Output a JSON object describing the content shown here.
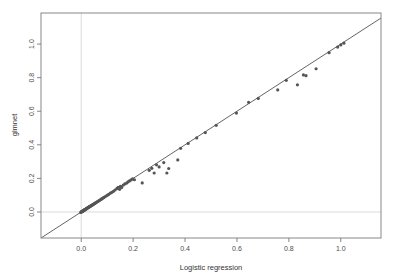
{
  "figure": {
    "background_color": "#ffffff",
    "plot_area": {
      "left": 41,
      "top": 13,
      "right": 381,
      "bottom": 238
    }
  },
  "chart_data": {
    "type": "scatter",
    "title": "",
    "xlabel": "Logistic regression",
    "ylabel": "glmnet",
    "xlim": [
      -0.155,
      1.155
    ],
    "ylim": [
      -0.155,
      1.185
    ],
    "xticks": [
      0.0,
      0.2,
      0.4,
      0.6,
      0.8,
      1.0
    ],
    "xtick_labels": [
      "0.0",
      "0.2",
      "0.4",
      "0.6",
      "0.8",
      "1.0"
    ],
    "yticks": [
      0.0,
      0.2,
      0.4,
      0.6,
      0.8,
      1.0
    ],
    "ytick_labels": [
      "0.0",
      "0.2",
      "0.4",
      "0.6",
      "0.8",
      "1.0"
    ],
    "grid": false,
    "legend": false,
    "reference_lines": {
      "identity_line": {
        "name": "y = x diagonal",
        "color": "#3c3c3c",
        "width": 0.8,
        "from": [
          -0.155,
          -0.155
        ],
        "to": [
          1.155,
          1.155
        ]
      },
      "zero_vertical": {
        "name": "x = 0 reference",
        "color": "#cccccc",
        "width": 0.7,
        "x": 0.0
      },
      "zero_horizontal": {
        "name": "y = 0 reference",
        "color": "#cccccc",
        "width": 0.7,
        "y": 0.0
      }
    },
    "marker": {
      "color": "#555555",
      "size": 1.6,
      "style": "point"
    },
    "series": [
      {
        "name": "coefficients",
        "x": [
          -0.002,
          0.0,
          0.001,
          0.002,
          0.003,
          0.004,
          0.005,
          0.006,
          0.007,
          0.008,
          0.009,
          0.01,
          0.011,
          0.012,
          0.013,
          0.014,
          0.015,
          0.016,
          0.018,
          0.019,
          0.02,
          0.021,
          0.022,
          0.024,
          0.025,
          0.026,
          0.028,
          0.029,
          0.03,
          0.032,
          0.034,
          0.035,
          0.037,
          0.039,
          0.041,
          0.043,
          0.045,
          0.047,
          0.049,
          0.052,
          0.054,
          0.057,
          0.06,
          0.063,
          0.066,
          0.069,
          0.072,
          0.076,
          0.079,
          0.083,
          0.087,
          0.091,
          0.096,
          0.101,
          0.106,
          0.112,
          0.118,
          0.124,
          0.13,
          0.137,
          0.142,
          0.148,
          0.151,
          0.156,
          0.162,
          0.168,
          0.175,
          0.18,
          0.186,
          0.192,
          0.198,
          0.205,
          0.235,
          0.262,
          0.272,
          0.281,
          0.29,
          0.3,
          0.318,
          0.33,
          0.337,
          0.372,
          0.383,
          0.412,
          0.445,
          0.478,
          0.52,
          0.598,
          0.645,
          0.682,
          0.757,
          0.79,
          0.833,
          0.856,
          0.866,
          0.905,
          0.955,
          0.988,
          1.0,
          1.012
        ],
        "y": [
          -0.003,
          0.0,
          0.001,
          0.001,
          0.003,
          0.003,
          0.005,
          0.005,
          0.007,
          0.007,
          0.009,
          0.01,
          0.011,
          0.011,
          0.013,
          0.014,
          0.014,
          0.016,
          0.017,
          0.019,
          0.019,
          0.021,
          0.022,
          0.023,
          0.025,
          0.026,
          0.027,
          0.029,
          0.03,
          0.031,
          0.033,
          0.035,
          0.036,
          0.038,
          0.04,
          0.042,
          0.044,
          0.046,
          0.048,
          0.051,
          0.053,
          0.056,
          0.059,
          0.062,
          0.065,
          0.068,
          0.071,
          0.075,
          0.078,
          0.082,
          0.086,
          0.09,
          0.095,
          0.1,
          0.105,
          0.112,
          0.117,
          0.123,
          0.131,
          0.139,
          0.147,
          0.135,
          0.152,
          0.146,
          0.16,
          0.167,
          0.172,
          0.179,
          0.185,
          0.191,
          0.197,
          0.192,
          0.173,
          0.248,
          0.26,
          0.232,
          0.281,
          0.268,
          0.294,
          0.232,
          0.259,
          0.31,
          0.379,
          0.408,
          0.441,
          0.473,
          0.516,
          0.589,
          0.653,
          0.676,
          0.727,
          0.784,
          0.757,
          0.816,
          0.812,
          0.853,
          0.949,
          0.982,
          0.995,
          1.005
        ]
      }
    ]
  }
}
